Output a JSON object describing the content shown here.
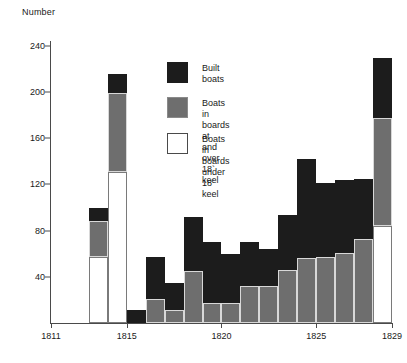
{
  "chart_data": {
    "type": "bar",
    "title": "",
    "subtitle": "",
    "xlabel": "",
    "ylabel": "Number",
    "ylim": [
      0,
      240
    ],
    "xlim": [
      1810.5,
      1829.5
    ],
    "grid": false,
    "stacked": true,
    "legend_position": "inside-upper-center",
    "ytick_labels": [
      "240",
      "200",
      "160",
      "120",
      "80",
      "40"
    ],
    "ytick_values": [
      240,
      200,
      160,
      120,
      80,
      40
    ],
    "xtick_labels": [
      "1811",
      "1815",
      "1820",
      "1825",
      "1829"
    ],
    "xtick_values": [
      1811,
      1815,
      1820,
      1825,
      1829
    ],
    "categories": [
      1814,
      1815,
      1816,
      1817,
      1818,
      1819,
      1820,
      1821,
      1822,
      1823,
      1824,
      1825,
      1826,
      1827,
      1828,
      1829
    ],
    "series": [
      {
        "name": "Boats in boards under 18' keel",
        "key": "under",
        "color": "#ffffff",
        "values": [
          57,
          131,
          0,
          0,
          0,
          0,
          0,
          0,
          0,
          0,
          0,
          0,
          0,
          0,
          0,
          84
        ]
      },
      {
        "name": "Boats in boards at and over 18' keel",
        "key": "over",
        "color": "#6e6e6e",
        "values": [
          31,
          68,
          0,
          21,
          11,
          45,
          17,
          17,
          32,
          32,
          46,
          56,
          57,
          61,
          73,
          94
        ]
      },
      {
        "name": "Built boats",
        "key": "built",
        "color": "#1c1c1c",
        "values": [
          12,
          17,
          11,
          36,
          24,
          47,
          53,
          43,
          38,
          32,
          48,
          86,
          64,
          63,
          52,
          52
        ]
      }
    ],
    "bar_totals": [
      100,
      216,
      11,
      57,
      35,
      92,
      70,
      60,
      70,
      64,
      94,
      142,
      121,
      124,
      125,
      230
    ],
    "annotations": []
  },
  "legend": {
    "items": [
      {
        "swatch": "built",
        "label": "Built boats"
      },
      {
        "swatch": "over",
        "label": "Boats in boards at\nand over 18` keel"
      },
      {
        "swatch": "under",
        "label": "Boats in boards\nunder 18` keel"
      }
    ]
  }
}
